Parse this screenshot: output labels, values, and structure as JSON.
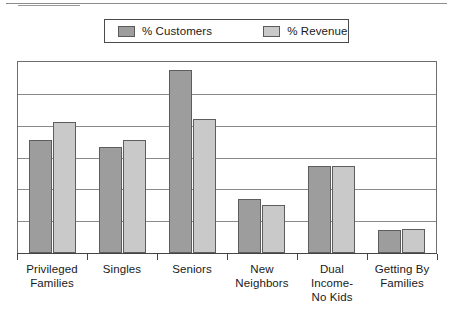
{
  "legend": {
    "entries": [
      {
        "label": "% Customers",
        "color": "#9d9d9d"
      },
      {
        "label": "% Revenue",
        "color": "#c9c9c9"
      }
    ]
  },
  "chart_data": {
    "type": "bar",
    "title": "",
    "subtitle": "",
    "xlabel": "",
    "ylabel": "",
    "ylim": [
      0,
      6
    ],
    "grid": true,
    "gridline_count": 5,
    "legend_position": "top",
    "orientation": "vertical",
    "categories": [
      "Privileged Families",
      "Singles",
      "Seniors",
      "New Neighbors",
      "Dual Income-No Kids",
      "Getting By Families"
    ],
    "category_lines": [
      [
        "Privileged",
        "Families"
      ],
      [
        "Singles"
      ],
      [
        "Seniors"
      ],
      [
        "New",
        "Neighbors"
      ],
      [
        "Dual",
        "Income-",
        "No Kids"
      ],
      [
        "Getting By",
        "Families"
      ]
    ],
    "series": [
      {
        "name": "% Customers",
        "color": "#9d9d9d",
        "values": [
          3.56,
          3.34,
          5.75,
          1.69,
          2.72,
          0.72
        ]
      },
      {
        "name": "% Revenue",
        "color": "#c9c9c9",
        "values": [
          4.1,
          3.56,
          4.2,
          1.5,
          2.72,
          0.75
        ]
      }
    ]
  }
}
